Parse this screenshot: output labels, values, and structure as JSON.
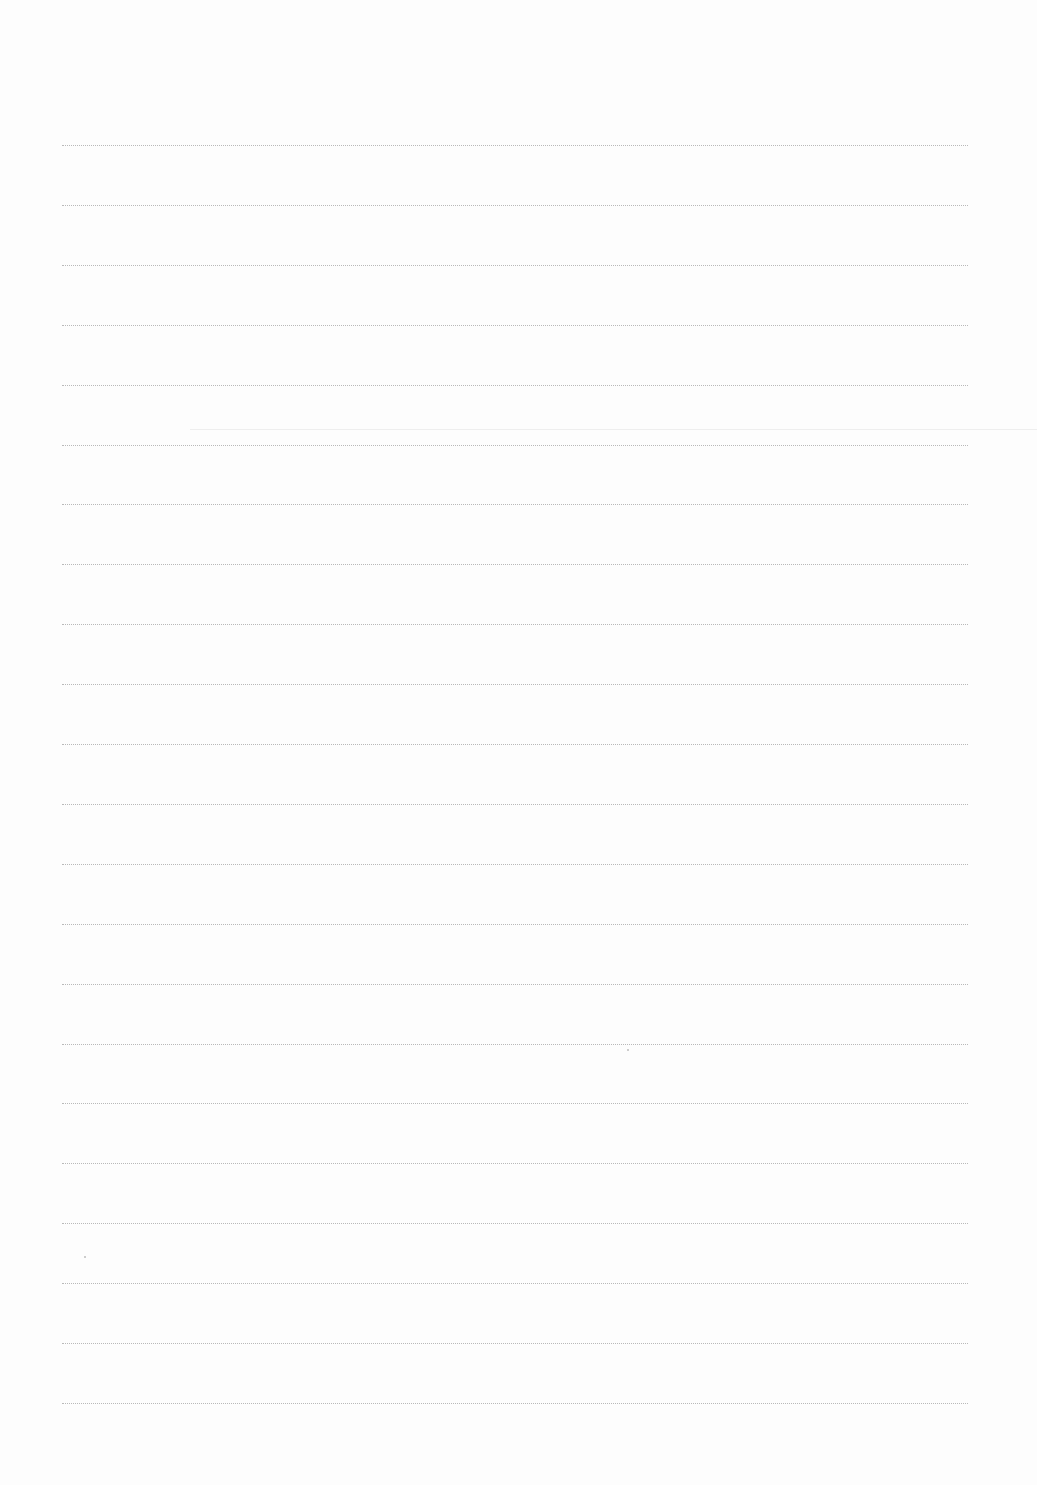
{
  "page": {
    "type": "blank ruled paper",
    "background": "#fdfdfd",
    "rule_color": "#b9b9b9",
    "rule_style": "dotted",
    "rule_count": 22,
    "rule_start_y": 145,
    "rule_spacing": 59.9,
    "rule_left": 62,
    "rule_right": 968,
    "text": []
  }
}
